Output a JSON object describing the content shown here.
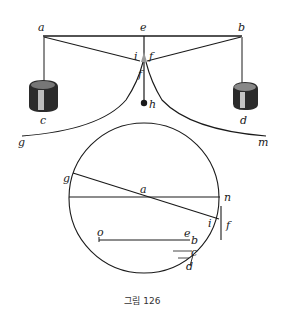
{
  "figure": {
    "caption": "그림 126",
    "upper": {
      "labels": {
        "a": "a",
        "e": "e",
        "b": "b",
        "i": "i",
        "f": "f",
        "fs": "f",
        "h": "h",
        "c": "c",
        "d": "d",
        "g": "g",
        "m": "m"
      }
    },
    "lower": {
      "labels": {
        "g": "g",
        "a": "a",
        "n": "n",
        "i": "i",
        "f": "f",
        "o": "o",
        "e": "e",
        "b": "b",
        "c": "c",
        "d": "d"
      }
    }
  }
}
